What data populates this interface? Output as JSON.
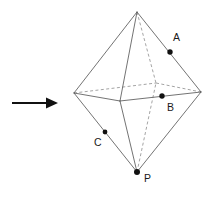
{
  "figure": {
    "canvas": {
      "width": 215,
      "height": 198
    },
    "background_color": "#ffffff",
    "colors": {
      "visible_edge": "#5a5a5a",
      "hidden_edge": "#8d8d8d",
      "dot": "#111111",
      "label": "#1a1a1a",
      "arrow": "#111111"
    },
    "vertices": {
      "top": {
        "name": "top-apex",
        "x": 137,
        "y": 12,
        "visible": true
      },
      "bottom": {
        "name": "bottom-apex",
        "x": 137,
        "y": 172,
        "visible": true
      },
      "left": {
        "name": "equator-left",
        "x": 74,
        "y": 93,
        "visible": true
      },
      "right": {
        "name": "equator-right",
        "x": 201,
        "y": 92,
        "visible": true
      },
      "front": {
        "name": "equator-front",
        "x": 120,
        "y": 101,
        "visible": true
      },
      "back": {
        "name": "equator-back",
        "x": 156,
        "y": 83,
        "visible": false
      }
    },
    "solid_edges": [
      {
        "name": "top-to-left",
        "x1": 137,
        "y1": 12,
        "x2": 74,
        "y2": 93
      },
      {
        "name": "top-to-right",
        "x1": 137,
        "y1": 12,
        "x2": 201,
        "y2": 92
      },
      {
        "name": "top-to-front",
        "x1": 137,
        "y1": 12,
        "x2": 120,
        "y2": 101
      },
      {
        "name": "bottom-to-left",
        "x1": 137,
        "y1": 172,
        "x2": 74,
        "y2": 93
      },
      {
        "name": "bottom-to-right",
        "x1": 137,
        "y1": 172,
        "x2": 201,
        "y2": 92
      },
      {
        "name": "bottom-to-front",
        "x1": 137,
        "y1": 172,
        "x2": 120,
        "y2": 101
      },
      {
        "name": "left-to-front",
        "x1": 74,
        "y1": 93,
        "x2": 120,
        "y2": 101
      },
      {
        "name": "front-to-right",
        "x1": 120,
        "y1": 101,
        "x2": 201,
        "y2": 92
      }
    ],
    "hidden_edges": [
      {
        "name": "top-to-back",
        "x1": 137,
        "y1": 12,
        "x2": 156,
        "y2": 83
      },
      {
        "name": "bottom-to-back",
        "x1": 137,
        "y1": 172,
        "x2": 156,
        "y2": 83
      },
      {
        "name": "left-to-back",
        "x1": 74,
        "y1": 93,
        "x2": 156,
        "y2": 83
      },
      {
        "name": "back-to-right",
        "x1": 156,
        "y1": 83,
        "x2": 201,
        "y2": 92
      }
    ],
    "labeled_points": [
      {
        "id": "A",
        "label": "A",
        "dot_x": 170,
        "dot_y": 52,
        "label_x": 173,
        "label_y": 41,
        "on_edge": "top-to-right"
      },
      {
        "id": "B",
        "label": "B",
        "dot_x": 162,
        "dot_y": 96,
        "label_x": 167,
        "label_y": 111,
        "on_edge": "front-to-right"
      },
      {
        "id": "C",
        "label": "C",
        "dot_x": 105,
        "dot_y": 132,
        "label_x": 94,
        "label_y": 146,
        "on_edge": "bottom-to-left"
      },
      {
        "id": "P",
        "label": "P",
        "dot_x": 137,
        "dot_y": 172,
        "label_x": 144,
        "label_y": 182,
        "on_edge": "bottom-apex"
      }
    ],
    "arrow": {
      "name": "pointer-arrow",
      "direction": "right",
      "shaft_x1": 12,
      "shaft_x2": 46,
      "y": 103,
      "tip_x": 58,
      "head_half_height": 5.5,
      "shaft_half_height": 1.1
    }
  }
}
